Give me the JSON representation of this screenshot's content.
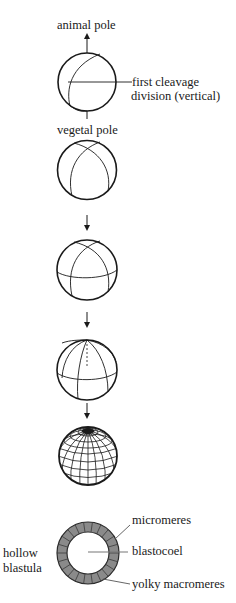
{
  "diagram": {
    "labels": {
      "animal_pole": "animal pole",
      "first_cleavage_line1": "first cleavage",
      "first_cleavage_line2": "division (vertical)",
      "vegetal_pole": "vegetal pole",
      "hollow_blastula_line1": "hollow",
      "hollow_blastula_line2": "blastula",
      "micromeres": "micromeres",
      "blastocoel": "blastocoel",
      "yolky_macromeres": "yolky macromeres"
    },
    "stages": [
      {
        "name": "first-cleavage",
        "cells": 2
      },
      {
        "name": "second-cleavage",
        "cells": 4
      },
      {
        "name": "third-cleavage",
        "cells": 8
      },
      {
        "name": "fourth-cleavage",
        "cells": 16
      },
      {
        "name": "morula",
        "cells": "many"
      },
      {
        "name": "hollow-blastula",
        "cells": "many"
      }
    ],
    "colors": {
      "line": "#1a1a1a",
      "ring_fill": "#8a8a8a",
      "ring_cell_border": "#3a3a3a",
      "background": "#ffffff"
    }
  }
}
